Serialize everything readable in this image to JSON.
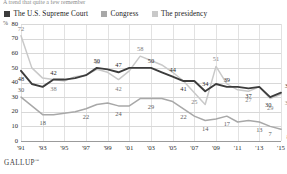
{
  "headline": "A trend that quite a few remember",
  "legend": [
    {
      "label": "The U.S. Supreme Court",
      "color": "#3c3c3c",
      "key": "court"
    },
    {
      "label": "Congress",
      "color": "#a8a8a8",
      "key": "congress"
    },
    {
      "label": "The presidency",
      "color": "#c9c9c9",
      "key": "presidency"
    }
  ],
  "axis": {
    "y_title": "%",
    "y_ticks": [
      "80",
      "70",
      "60",
      "50",
      "40",
      "30",
      "20",
      "10",
      "0"
    ],
    "x_ticks": [
      "'91",
      "'93",
      "'95",
      "'97",
      "'99",
      "'01",
      "'03",
      "'05",
      "'07",
      "'09",
      "'11",
      "'13",
      "'15"
    ]
  },
  "source": "GALLUP",
  "source_mark": "™",
  "chart_data": {
    "type": "line",
    "title": "A trend that quite a few remember",
    "xlabel": "",
    "ylabel": "%",
    "ylim": [
      0,
      80
    ],
    "grid": true,
    "legend_position": "top",
    "x": [
      1991,
      1992,
      1993,
      1994,
      1995,
      1996,
      1997,
      1998,
      1999,
      2000,
      2001,
      2002,
      2003,
      2004,
      2005,
      2006,
      2007,
      2008,
      2009,
      2010,
      2011,
      2012,
      2013,
      2014,
      2015
    ],
    "x_tick_labels": [
      "'91",
      "'93",
      "'95",
      "'97",
      "'99",
      "'01",
      "'03",
      "'05",
      "'07",
      "'09",
      "'11",
      "'13",
      "'15"
    ],
    "series": [
      {
        "name": "The U.S. Supreme Court",
        "color": "#3c3c3c",
        "values": [
          48,
          39,
          37,
          42,
          42,
          43,
          45,
          50,
          49,
          47,
          50,
          50,
          50,
          47,
          44,
          41,
          41,
          34,
          39,
          37,
          37,
          36,
          37,
          30,
          33
        ],
        "point_labels": [
          {
            "x": 1991,
            "value": 48
          },
          {
            "x": 1994,
            "value": 42
          },
          {
            "x": 1998,
            "value": 50
          },
          {
            "x": 2000,
            "value": 47
          },
          {
            "x": 2003,
            "value": 50
          },
          {
            "x": 2005,
            "value": 44
          },
          {
            "x": 2006,
            "value": 41
          },
          {
            "x": 2008,
            "value": 34
          },
          {
            "x": 2010,
            "value": 39
          },
          {
            "x": 2012,
            "value": 37
          },
          {
            "x": 2014,
            "value": 30
          },
          {
            "x": 2015,
            "value": 33
          }
        ]
      },
      {
        "name": "Congress",
        "color": "#a8a8a8",
        "values": [
          30,
          24,
          18,
          18,
          19,
          20,
          22,
          25,
          26,
          24,
          24,
          29,
          29,
          29,
          27,
          22,
          17,
          14,
          15,
          17,
          13,
          14,
          13,
          10,
          8
        ],
        "point_labels": [
          {
            "x": 1991,
            "value": 30
          },
          {
            "x": 1993,
            "value": 18
          },
          {
            "x": 1997,
            "value": 22
          },
          {
            "x": 2000,
            "value": 24
          },
          {
            "x": 2003,
            "value": 29
          },
          {
            "x": 2006,
            "value": 22
          },
          {
            "x": 2008,
            "value": 14
          },
          {
            "x": 2010,
            "value": 17
          },
          {
            "x": 2013,
            "value": 13
          },
          {
            "x": 2014,
            "value": 7
          },
          {
            "x": 2015,
            "value": 8
          }
        ]
      },
      {
        "name": "The presidency",
        "color": "#c9c9c9",
        "values": [
          72,
          50,
          43,
          42,
          41,
          44,
          45,
          49,
          47,
          42,
          48,
          58,
          55,
          52,
          47,
          41,
          33,
          25,
          51,
          39,
          35,
          34,
          37,
          29,
          32
        ],
        "point_labels": [
          {
            "x": 1991,
            "value": 72
          },
          {
            "x": 1994,
            "value": 38
          },
          {
            "x": 1998,
            "value": 49
          },
          {
            "x": 2000,
            "value": 42
          },
          {
            "x": 2002,
            "value": 58
          },
          {
            "x": 2007,
            "value": 25
          },
          {
            "x": 2009,
            "value": 51
          },
          {
            "x": 2012,
            "value": 27
          },
          {
            "x": 2014,
            "value": 29
          },
          {
            "x": 2015,
            "value": 32
          }
        ]
      }
    ]
  }
}
